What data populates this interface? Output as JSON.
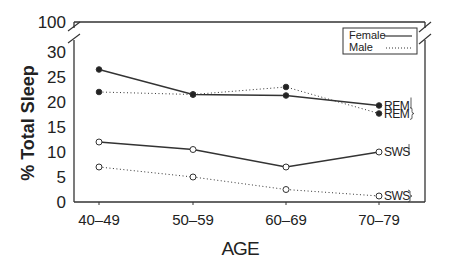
{
  "chart_data": {
    "type": "line",
    "title": "",
    "xlabel": "AGE",
    "ylabel": "% Total Sleep",
    "categories": [
      "40–49",
      "50–59",
      "60–69",
      "70–79"
    ],
    "y_ticks": [
      "0",
      "5",
      "10",
      "15",
      "20",
      "25",
      "30",
      "100"
    ],
    "ylim": [
      0,
      30
    ],
    "y_axis_break": {
      "from": 30,
      "to": 100
    },
    "grid": false,
    "legend_position": "upper right",
    "legend": [
      {
        "label": "Female",
        "style": "solid"
      },
      {
        "label": "Male",
        "style": "dotted"
      }
    ],
    "series": [
      {
        "name": "Female REM",
        "sex": "Female",
        "stage": "REM",
        "style": "solid",
        "marker": "filled-circle",
        "values": [
          26.5,
          21.5,
          21.3,
          19.3
        ],
        "end_label": "REM"
      },
      {
        "name": "Male REM",
        "sex": "Male",
        "stage": "REM",
        "style": "dotted",
        "marker": "filled-circle",
        "values": [
          22,
          21.5,
          23,
          17.7
        ],
        "end_label": "REM"
      },
      {
        "name": "Female SWS",
        "sex": "Female",
        "stage": "SWS",
        "style": "solid",
        "marker": "open-circle",
        "values": [
          12,
          10.5,
          7,
          10
        ],
        "end_label": "SWS"
      },
      {
        "name": "Male SWS",
        "sex": "Male",
        "stage": "SWS",
        "style": "dotted",
        "marker": "open-circle",
        "values": [
          7,
          5,
          2.5,
          1.2
        ],
        "end_label": "SWS"
      }
    ]
  },
  "colors": {
    "line": "#333333",
    "axis": "#333333",
    "text": "#222222",
    "background": "#ffffff"
  }
}
